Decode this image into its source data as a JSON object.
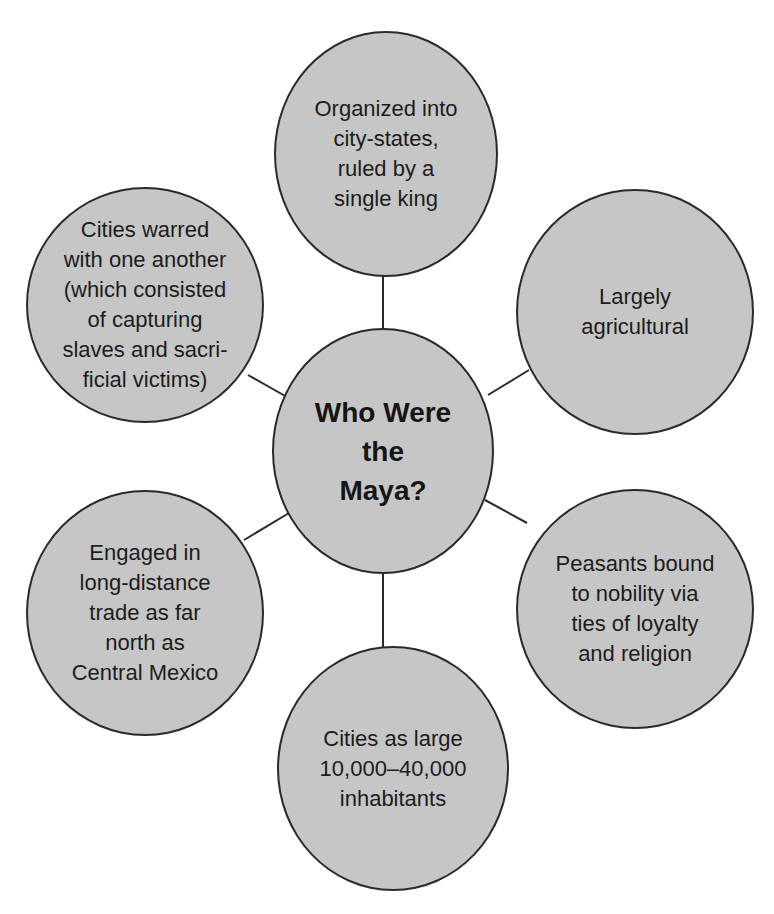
{
  "diagram": {
    "type": "concept-web",
    "center": {
      "label": "Who Were\nthe\nMaya?"
    },
    "nodes": [
      {
        "id": "top",
        "label": "Organized into\ncity-states,\nruled by a\nsingle king"
      },
      {
        "id": "upper-right",
        "label": "Largely\nagricultural"
      },
      {
        "id": "lower-right",
        "label": "Peasants bound\nto nobility via\nties of loyalty\nand religion"
      },
      {
        "id": "bottom",
        "label": "Cities as large\n10,000–40,000\ninhabitants"
      },
      {
        "id": "lower-left",
        "label": "Engaged in\nlong-distance\ntrade as far\nnorth as\nCentral Mexico"
      },
      {
        "id": "upper-left",
        "label": "Cities warred\nwith one another\n(which consisted\nof capturing\nslaves and sacri-\nficial victims)"
      }
    ],
    "colors": {
      "fill": "#c6c6c6",
      "stroke": "#2a2a2a",
      "background": "#ffffff"
    }
  }
}
